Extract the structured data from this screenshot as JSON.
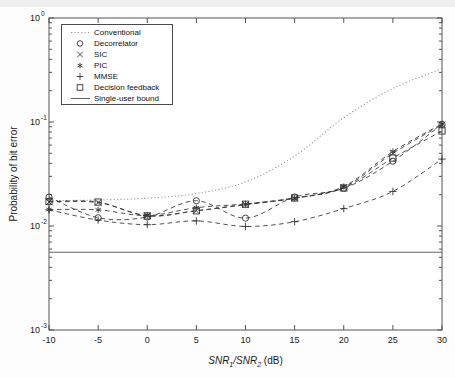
{
  "figure": {
    "background": "#ffffff",
    "axis_color": "#555555",
    "curve_color": "#333333",
    "dotted_color": "#999999"
  },
  "chart_data": {
    "type": "line",
    "title": "",
    "xlabel": "SNR_1/SNR_2 (dB)",
    "xlabel_parts": {
      "pre": "SNR",
      "sub1": "1",
      "slash": "/SNR",
      "sub2": "2",
      "post": " (dB)"
    },
    "ylabel": "Probability of bit error",
    "xlim": [
      -10,
      30
    ],
    "ylim": [
      0.001,
      1
    ],
    "yscale": "log",
    "xticks": [
      -10,
      -5,
      0,
      5,
      10,
      15,
      20,
      25,
      30
    ],
    "xticklabels": [
      "-10",
      "-5",
      "0",
      "5",
      "10",
      "15",
      "20",
      "25",
      "30"
    ],
    "yticks": [
      0.001,
      0.01,
      0.1,
      1
    ],
    "yticklabels": [
      "10^-3",
      "10^-2",
      "10^-1",
      "10^0"
    ],
    "ytick_parts": [
      {
        "base": "10",
        "exp": "-3"
      },
      {
        "base": "10",
        "exp": "-2"
      },
      {
        "base": "10",
        "exp": "-1"
      },
      {
        "base": "10",
        "exp": "0"
      }
    ],
    "grid": false,
    "legend_position": "upper left",
    "x": [
      -10,
      -5,
      0,
      5,
      10,
      15,
      20,
      25,
      30
    ],
    "series": [
      {
        "name": "Conventional",
        "marker": "none",
        "linestyle": "dotted",
        "values": [
          0.0175,
          0.0178,
          0.0185,
          0.0205,
          0.0265,
          0.047,
          0.11,
          0.21,
          0.325
        ]
      },
      {
        "name": "Decorrelator",
        "marker": "circle",
        "linestyle": "dashed",
        "values": [
          0.019,
          0.012,
          0.0122,
          0.0175,
          0.0119,
          0.019,
          0.023,
          0.042,
          0.095
        ]
      },
      {
        "name": "SIC",
        "marker": "x",
        "linestyle": "dashed",
        "values": [
          0.017,
          0.0168,
          0.0126,
          0.014,
          0.016,
          0.0185,
          0.0235,
          0.05,
          0.094
        ]
      },
      {
        "name": "PIC",
        "marker": "asterisk",
        "linestyle": "dashed",
        "values": [
          0.0144,
          0.0143,
          0.0126,
          0.015,
          0.0163,
          0.0185,
          0.024,
          0.052,
          0.096
        ]
      },
      {
        "name": "MMSE",
        "marker": "plus",
        "linestyle": "dashed",
        "values": [
          0.0143,
          0.0114,
          0.0103,
          0.0112,
          0.0099,
          0.011,
          0.0147,
          0.0215,
          0.044
        ]
      },
      {
        "name": "Decision feedback",
        "marker": "square",
        "linestyle": "dashed",
        "values": [
          0.0172,
          0.017,
          0.0125,
          0.014,
          0.0162,
          0.0186,
          0.0232,
          0.045,
          0.082
        ]
      },
      {
        "name": "Single-user bound",
        "marker": "none",
        "linestyle": "solid",
        "constant": 0.0056,
        "values": [
          0.0056,
          0.0056,
          0.0056,
          0.0056,
          0.0056,
          0.0056,
          0.0056,
          0.0056,
          0.0056
        ]
      }
    ]
  },
  "legend": {
    "entries": [
      {
        "label": "Conventional",
        "marker": "none",
        "linestyle": "dotted"
      },
      {
        "label": "Decorrelator",
        "marker": "circle",
        "linestyle": "none"
      },
      {
        "label": "SIC",
        "marker": "x",
        "linestyle": "none"
      },
      {
        "label": "PIC",
        "marker": "asterisk",
        "linestyle": "none"
      },
      {
        "label": "MMSE",
        "marker": "plus",
        "linestyle": "none"
      },
      {
        "label": "Decision feedback",
        "marker": "square",
        "linestyle": "none"
      },
      {
        "label": "Single-user bound",
        "marker": "none",
        "linestyle": "solid"
      }
    ]
  }
}
